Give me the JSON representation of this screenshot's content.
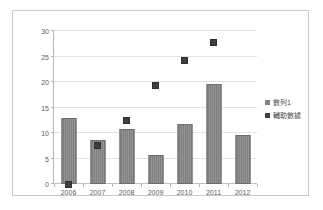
{
  "chart_data": {
    "type": "bar",
    "title": "",
    "xlabel": "",
    "ylabel": "",
    "categories": [
      "2006",
      "2007",
      "2008",
      "2009",
      "2010",
      "2011",
      "2012"
    ],
    "ylim": [
      0,
      30
    ],
    "yticks": [
      0,
      5,
      10,
      15,
      20,
      25,
      30
    ],
    "grid": true,
    "legend_position": "right",
    "series": [
      {
        "name": "數列1",
        "render": "bar",
        "color": "#7f7f7f",
        "values": [
          12.9,
          8.7,
          10.7,
          5.7,
          11.7,
          19.7,
          9.7
        ]
      },
      {
        "name": "輔助數據",
        "render": "marker",
        "color": "#404040",
        "values": [
          0.0,
          7.5,
          12.4,
          19.3,
          24.3,
          27.7,
          null
        ]
      }
    ]
  },
  "axes": {
    "ytick_labels": [
      "0",
      "5",
      "10",
      "15",
      "20",
      "25",
      "30"
    ],
    "xtick_labels": [
      "2006",
      "2007",
      "2008",
      "2009",
      "2010",
      "2011",
      "2012"
    ]
  },
  "legend": {
    "items": [
      {
        "label": "數列1",
        "color": "#7f7f7f"
      },
      {
        "label": "輔助數據",
        "color": "#404040"
      }
    ]
  },
  "colors": {
    "bar": "#7f7f7f",
    "marker": "#404040",
    "gridline": "#e2e2e2",
    "axis": "#b5b5b5",
    "frame": "#c9c9c9",
    "text": "#5d5d5d",
    "background": "#ffffff"
  }
}
